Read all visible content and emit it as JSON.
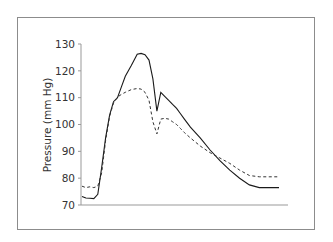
{
  "chart_data": {
    "type": "line",
    "title": "",
    "xlabel": "",
    "ylabel": "Pressure (mm Hg)",
    "ylim": [
      70,
      130
    ],
    "yticks": [
      70,
      80,
      90,
      100,
      110,
      120,
      130
    ],
    "grid": false,
    "legend": null,
    "x": [
      0,
      2,
      4,
      6,
      8,
      10,
      12,
      14,
      16,
      18,
      20,
      22,
      25,
      28,
      30,
      32,
      34,
      36,
      38,
      40,
      42,
      44,
      46,
      48,
      50,
      52,
      55,
      60,
      65,
      70,
      75,
      80,
      85,
      90,
      95,
      100
    ],
    "series": [
      {
        "name": "solid",
        "style": "solid",
        "values": [
          73.2,
          72.6,
          72.5,
          72.4,
          74,
          84,
          95,
          103.5,
          108.5,
          110,
          114,
          118,
          122,
          126.2,
          126.5,
          126,
          124,
          117,
          105,
          112,
          110.5,
          109,
          107.5,
          106,
          104,
          102,
          99,
          95,
          90.5,
          86.5,
          83,
          80,
          77.5,
          76.5,
          76.5,
          76.5
        ]
      },
      {
        "name": "dashed",
        "style": "dashed",
        "values": [
          77,
          76.5,
          76.8,
          76.5,
          77,
          82,
          94,
          103,
          108,
          110.2,
          111.2,
          112,
          113,
          113.4,
          113.2,
          112,
          109,
          101,
          96.5,
          102,
          102.3,
          102,
          101,
          100,
          98.5,
          97,
          95,
          92,
          89.5,
          87.5,
          85.5,
          83,
          81,
          80.5,
          80.5,
          80.5
        ]
      }
    ]
  }
}
